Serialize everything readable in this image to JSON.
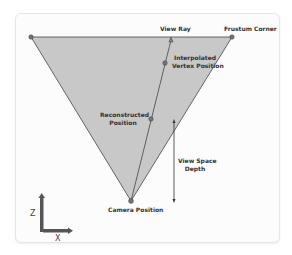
{
  "diagram": {
    "labels": {
      "view_ray": "View Ray",
      "frustum_corner": "Frustum Corner",
      "interpolated_line1": "Interpolated",
      "interpolated_line2": "Vertex Position",
      "reconstructed_line1": "Reconstructed",
      "reconstructed_line2": "Position",
      "depth_line1": "View Space",
      "depth_line2": "Depth",
      "camera": "Camera Position",
      "axis_z": "Z",
      "axis_x": "X"
    },
    "colors": {
      "frustum_fill": "#c8c8c8",
      "line": "#444444",
      "point": "#666666",
      "axis": "#555555"
    }
  }
}
